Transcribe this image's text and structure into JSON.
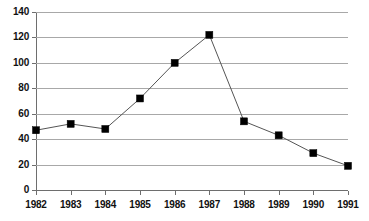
{
  "chart_data": {
    "type": "line",
    "title": "",
    "subtitle": "",
    "xlabel": "",
    "ylabel": "",
    "categories": [
      "1982",
      "1983",
      "1984",
      "1985",
      "1986",
      "1987",
      "1988",
      "1989",
      "1990",
      "1991"
    ],
    "values": [
      47,
      52,
      48,
      72,
      100,
      122,
      54,
      43,
      29,
      19
    ],
    "series": [
      {
        "name": "",
        "values": [
          47,
          52,
          48,
          72,
          100,
          122,
          54,
          43,
          29,
          19
        ]
      }
    ],
    "ylim": [
      0,
      140
    ],
    "y_ticks": [
      0,
      20,
      40,
      60,
      80,
      100,
      120,
      140
    ],
    "y_tick_labels": [
      "0",
      "20",
      "40",
      "60",
      "80",
      "100",
      "120",
      "140"
    ],
    "x_tick_labels": [
      "1982",
      "1983",
      "1984",
      "1985",
      "1986",
      "1987",
      "1988",
      "1989",
      "1990",
      "1991"
    ],
    "grid": true,
    "grid_axis": "y",
    "legend": false,
    "legend_position": "none",
    "marker": "square",
    "marker_color": "#000000",
    "line_color": "#555555",
    "grid_color": "#a8a8a8",
    "axis_color": "#6e6e6e",
    "background_color": "#ffffff",
    "annotations": []
  }
}
